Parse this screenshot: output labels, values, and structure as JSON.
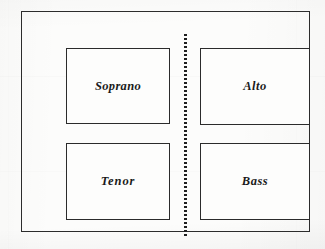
{
  "diagram": {
    "background_color": "#fcfcfb",
    "line_color": "#2c2c2c",
    "divider": {
      "name": "vertical-dotted-divider",
      "style": "dotted",
      "orientation": "vertical"
    },
    "parts": [
      {
        "id": "soprano",
        "label": "Soprano",
        "position": "top-left"
      },
      {
        "id": "alto",
        "label": "Alto",
        "position": "top-right"
      },
      {
        "id": "tenor",
        "label": "Tenor",
        "position": "bottom-left"
      },
      {
        "id": "bass",
        "label": "Bass",
        "position": "bottom-right"
      }
    ]
  }
}
